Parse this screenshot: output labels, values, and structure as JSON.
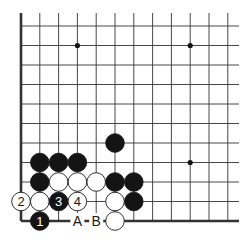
{
  "diagram": {
    "type": "go-board-fragment",
    "background": "#ffffff",
    "line_color": "#333333",
    "grid": {
      "columns": 12,
      "rows": 11,
      "origin_x": 21,
      "origin_y": 26,
      "col_spacing": 18.8,
      "row_spacing": 19.5,
      "left_edge": true,
      "bottom_edge": true,
      "top_extent_y": 13,
      "right_extent_x": 239
    },
    "star_points": [
      {
        "col": 3,
        "row": 1
      },
      {
        "col": 9,
        "row": 1
      },
      {
        "col": 9,
        "row": 7
      }
    ],
    "stones": [
      {
        "col": 5,
        "row": 6,
        "color": "black",
        "label": ""
      },
      {
        "col": 1,
        "row": 7,
        "color": "black",
        "label": ""
      },
      {
        "col": 2,
        "row": 7,
        "color": "black",
        "label": ""
      },
      {
        "col": 3,
        "row": 7,
        "color": "black",
        "label": ""
      },
      {
        "col": 1,
        "row": 8,
        "color": "black",
        "label": ""
      },
      {
        "col": 2,
        "row": 8,
        "color": "white",
        "label": ""
      },
      {
        "col": 3,
        "row": 8,
        "color": "white",
        "label": ""
      },
      {
        "col": 4,
        "row": 8,
        "color": "white",
        "label": ""
      },
      {
        "col": 5,
        "row": 8,
        "color": "black",
        "label": ""
      },
      {
        "col": 6,
        "row": 8,
        "color": "black",
        "label": ""
      },
      {
        "col": 0,
        "row": 9,
        "color": "white",
        "label": "2"
      },
      {
        "col": 1,
        "row": 9,
        "color": "white",
        "label": ""
      },
      {
        "col": 2,
        "row": 9,
        "color": "black",
        "label": "3"
      },
      {
        "col": 3,
        "row": 9,
        "color": "white",
        "label": "4"
      },
      {
        "col": 5,
        "row": 9,
        "color": "white",
        "label": ""
      },
      {
        "col": 6,
        "row": 9,
        "color": "black",
        "label": ""
      },
      {
        "col": 1,
        "row": 10,
        "color": "black",
        "label": "1"
      },
      {
        "col": 5,
        "row": 10,
        "color": "white",
        "label": ""
      }
    ],
    "point_labels": [
      {
        "col": 3,
        "row": 10,
        "text": "A"
      },
      {
        "col": 4,
        "row": 10,
        "text": "B"
      }
    ]
  }
}
